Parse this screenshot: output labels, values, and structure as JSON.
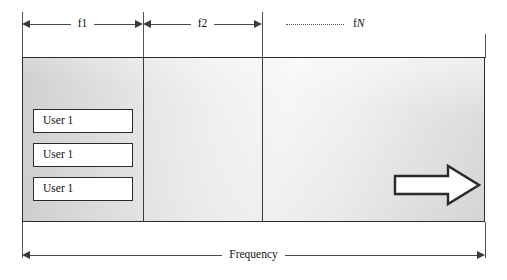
{
  "diagram": {
    "band": {
      "name": "frequency-spectrum-band"
    },
    "top_dimensions": [
      {
        "label": "f1",
        "name": "dimension-f1"
      },
      {
        "label": "f2",
        "name": "dimension-f2"
      }
    ],
    "continuation": {
      "dots": "..............",
      "label_prefix": "f",
      "label_italic": "N"
    },
    "user_boxes": [
      {
        "label": "User 1"
      },
      {
        "label": "User 1"
      },
      {
        "label": "User 1"
      }
    ],
    "bottom_dimension": {
      "label": "Frequency",
      "name": "dimension-frequency"
    },
    "direction_arrow": {
      "name": "right-block-arrow",
      "direction": "right"
    },
    "colors": {
      "outline": "#2b2b2b",
      "divider": "#3a3a3a",
      "dimension_line": "#4a4a4a",
      "box_fill": "#ffffff",
      "text": "#111111"
    }
  }
}
